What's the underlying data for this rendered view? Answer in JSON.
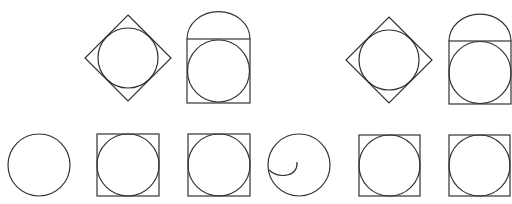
{
  "diagram": {
    "stroke_color": "#333333",
    "background_color": "#ffffff",
    "top_left_group": [
      {
        "id": "diamond-with-inscribed-circle-1",
        "shape": "diamond",
        "cx": 128,
        "cy": 58,
        "half_diag": 43,
        "circle_r": 30
      },
      {
        "id": "dome-rect-with-circle-1",
        "shape": "rect-with-semicircle-top",
        "x": 187,
        "y": 39,
        "w": 63,
        "h": 64,
        "circle_r": 31
      }
    ],
    "top_right_group": [
      {
        "id": "diamond-with-inscribed-circle-2",
        "shape": "diamond",
        "cx": 389,
        "cy": 60,
        "half_diag": 43,
        "circle_r": 30
      },
      {
        "id": "dome-rect-with-circle-2",
        "shape": "rect-with-semicircle-top",
        "x": 449,
        "y": 41,
        "w": 62,
        "h": 63,
        "circle_r": 31
      }
    ],
    "bottom_row": [
      {
        "id": "plain-circle",
        "shape": "circle",
        "cx": 39,
        "cy": 165,
        "r": 31
      },
      {
        "id": "square-with-circle-1",
        "shape": "square-with-inscribed-circle",
        "x": 97,
        "y": 134,
        "size": 62
      },
      {
        "id": "square-with-circle-2",
        "shape": "square-with-inscribed-circle",
        "x": 188,
        "y": 134,
        "size": 62
      },
      {
        "id": "circle-with-spiral",
        "shape": "circle-with-inner-arc",
        "cx": 299,
        "cy": 165,
        "r": 31
      },
      {
        "id": "square-with-circle-3",
        "shape": "square-with-inscribed-circle",
        "x": 359,
        "y": 135,
        "size": 61
      },
      {
        "id": "square-with-circle-4",
        "shape": "square-with-inscribed-circle",
        "x": 449,
        "y": 135,
        "size": 61
      }
    ]
  }
}
